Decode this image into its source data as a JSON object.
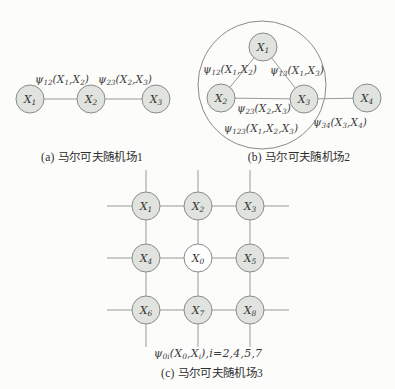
{
  "colors": {
    "background": "#fcfcfa",
    "node_fill": "#e1e4de",
    "node_fill_open": "#ffffff",
    "node_stroke": "#878c88",
    "edge_stroke": "#9a9a9a",
    "enclosure_stroke": "#8a8a8a",
    "text": "#333333"
  },
  "subfigures": {
    "a": {
      "caption": "(a) 马尔可夫随机场1",
      "nodes": [
        {
          "id": "X1",
          "label": "X_{1}"
        },
        {
          "id": "X2",
          "label": "X_{2}"
        },
        {
          "id": "X3",
          "label": "X_{3}"
        }
      ],
      "edges": [
        "X1-X2",
        "X2-X3"
      ],
      "edge_labels": [
        {
          "edge": "X1-X2",
          "text": "ψ_{12}(X_{1},X_{2})"
        },
        {
          "edge": "X2-X3",
          "text": "ψ_{23}(X_{2},X_{3})"
        }
      ]
    },
    "b": {
      "caption": "(b) 马尔可夫随机场2",
      "nodes": [
        {
          "id": "X1",
          "label": "X_{1}"
        },
        {
          "id": "X2",
          "label": "X_{2}"
        },
        {
          "id": "X3",
          "label": "X_{3}"
        },
        {
          "id": "X4",
          "label": "X_{4}"
        }
      ],
      "edges": [
        "X1-X2",
        "X1-X3",
        "X2-X3",
        "X3-X4"
      ],
      "labels": [
        {
          "for": "edge X1-X2",
          "text": "ψ_{12}(X_{1},X_{2})"
        },
        {
          "for": "edge X1-X3",
          "text": "ψ_{13}(X_{1},X_{3})"
        },
        {
          "for": "edge X2-X3",
          "text": "ψ_{23}(X_{2},X_{3})"
        },
        {
          "for": "clique X1-X2-X3",
          "text": "ψ_{123}(X_{1},X_{2},X_{3})"
        },
        {
          "for": "edge X3-X4",
          "text": "ψ_{34}(X_{3},X_{4})"
        }
      ]
    },
    "c": {
      "caption": "(c) 马尔可夫随机场3",
      "nodes": [
        {
          "id": "X1",
          "label": "X_{1}"
        },
        {
          "id": "X2",
          "label": "X_{2}"
        },
        {
          "id": "X3",
          "label": "X_{3}"
        },
        {
          "id": "X4",
          "label": "X_{4}"
        },
        {
          "id": "X0",
          "label": "X_{0}",
          "open": true
        },
        {
          "id": "X5",
          "label": "X_{5}"
        },
        {
          "id": "X6",
          "label": "X_{6}"
        },
        {
          "id": "X7",
          "label": "X_{7}"
        },
        {
          "id": "X8",
          "label": "X_{8}"
        }
      ],
      "edges": [
        "X1-X2",
        "X2-X3",
        "X1-X4",
        "X2-X0",
        "X3-X5",
        "X4-X0",
        "X0-X5",
        "X4-X6",
        "X0-X7",
        "X5-X8",
        "X6-X7",
        "X7-X8"
      ],
      "potential_label": "ψ_{0i}(X_{0},X_{i}),i=2,4,5,7"
    }
  }
}
